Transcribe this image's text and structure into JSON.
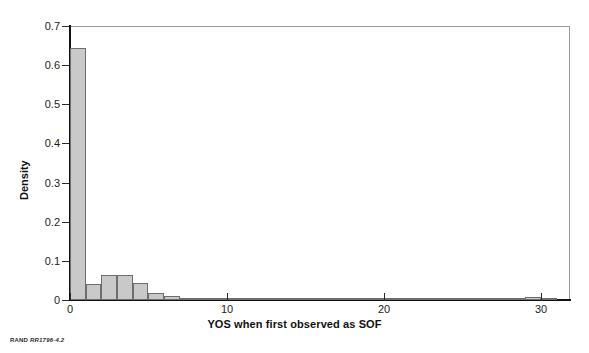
{
  "figure": {
    "source_credit_prefix": "RAND",
    "source_credit_id": "RR1796-4.2"
  },
  "chart_data": {
    "type": "bar",
    "title": "",
    "subtitle": "",
    "xlabel": "YOS when first observed as SOF",
    "ylabel": "Density",
    "xlim": [
      0,
      31.85
    ],
    "ylim": [
      0,
      0.7
    ],
    "grid": false,
    "legend": null,
    "x_ticks": [
      0,
      10,
      20,
      30
    ],
    "x_tick_labels": [
      "0",
      "10",
      "20",
      "30"
    ],
    "y_ticks": [
      0,
      0.1,
      0.2,
      0.3,
      0.4,
      0.5,
      0.6,
      0.7
    ],
    "y_tick_labels": [
      "0",
      "0.1",
      "0.2",
      "0.3",
      "0.4",
      "0.5",
      "0.6",
      "0.7"
    ],
    "bin_width": 1,
    "bar_fill_color": "#c9c9c9",
    "bar_edge_color": "#6e6e6e",
    "bins": [
      {
        "x0": 0,
        "x1": 1,
        "value": 0.645
      },
      {
        "x0": 1,
        "x1": 2,
        "value": 0.04
      },
      {
        "x0": 2,
        "x1": 3,
        "value": 0.064
      },
      {
        "x0": 3,
        "x1": 4,
        "value": 0.064
      },
      {
        "x0": 4,
        "x1": 5,
        "value": 0.043
      },
      {
        "x0": 5,
        "x1": 6,
        "value": 0.019
      },
      {
        "x0": 6,
        "x1": 7,
        "value": 0.01
      },
      {
        "x0": 7,
        "x1": 8,
        "value": 0.006
      },
      {
        "x0": 8,
        "x1": 9,
        "value": 0.003
      },
      {
        "x0": 9,
        "x1": 10,
        "value": 0.002
      },
      {
        "x0": 10,
        "x1": 11,
        "value": 0.004
      },
      {
        "x0": 11,
        "x1": 12,
        "value": 0.002
      },
      {
        "x0": 12,
        "x1": 13,
        "value": 0.001
      },
      {
        "x0": 13,
        "x1": 14,
        "value": 0.001
      },
      {
        "x0": 14,
        "x1": 15,
        "value": 0.001
      },
      {
        "x0": 15,
        "x1": 16,
        "value": 0.005
      },
      {
        "x0": 16,
        "x1": 17,
        "value": 0.005
      },
      {
        "x0": 17,
        "x1": 18,
        "value": 0.005
      },
      {
        "x0": 18,
        "x1": 19,
        "value": 0.004
      },
      {
        "x0": 19,
        "x1": 20,
        "value": 0.005
      },
      {
        "x0": 20,
        "x1": 21,
        "value": 0.005
      },
      {
        "x0": 21,
        "x1": 22,
        "value": 0.003
      },
      {
        "x0": 22,
        "x1": 23,
        "value": 0.001
      },
      {
        "x0": 23,
        "x1": 24,
        "value": 0.001
      },
      {
        "x0": 24,
        "x1": 25,
        "value": 0.001
      },
      {
        "x0": 25,
        "x1": 26,
        "value": 0.002
      },
      {
        "x0": 26,
        "x1": 27,
        "value": 0.001
      },
      {
        "x0": 27,
        "x1": 28,
        "value": 0.001
      },
      {
        "x0": 28,
        "x1": 29,
        "value": 0.002
      },
      {
        "x0": 29,
        "x1": 30,
        "value": 0.007
      },
      {
        "x0": 30,
        "x1": 31,
        "value": 0.002
      }
    ]
  }
}
